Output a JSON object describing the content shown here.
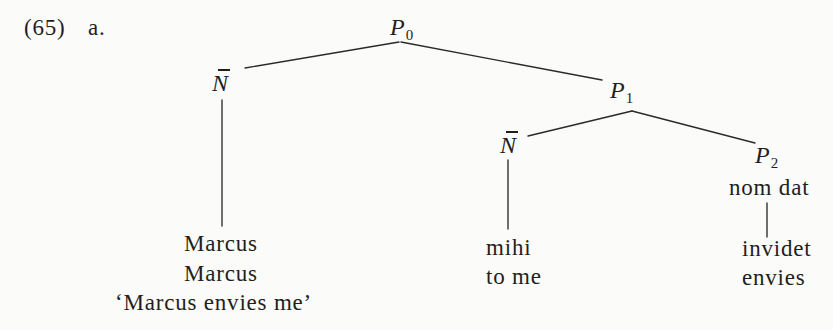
{
  "example": {
    "number": "(65)",
    "sublabel": "a."
  },
  "tree": {
    "nodes": [
      {
        "id": "P0",
        "label": "P",
        "subscript": "0"
      },
      {
        "id": "Nbar_1",
        "label": "N",
        "bar": true
      },
      {
        "id": "P1",
        "label": "P",
        "subscript": "1"
      },
      {
        "id": "Nbar_2",
        "label": "N",
        "bar": true
      },
      {
        "id": "P2",
        "label": "P",
        "subscript": "2",
        "features": "nom dat"
      }
    ],
    "edges": [
      [
        "P0",
        "Nbar_1"
      ],
      [
        "P0",
        "P1"
      ],
      [
        "P1",
        "Nbar_2"
      ],
      [
        "P1",
        "P2"
      ],
      [
        "Nbar_1",
        "leaf_0"
      ],
      [
        "Nbar_2",
        "leaf_1"
      ],
      [
        "P2",
        "leaf_2"
      ]
    ],
    "leaves": [
      {
        "word": "Marcus",
        "gloss": "Marcus"
      },
      {
        "word": "mihi",
        "gloss": "to me"
      },
      {
        "word": "invidet",
        "gloss": "envies"
      }
    ]
  },
  "translation": "‘Marcus envies me’"
}
